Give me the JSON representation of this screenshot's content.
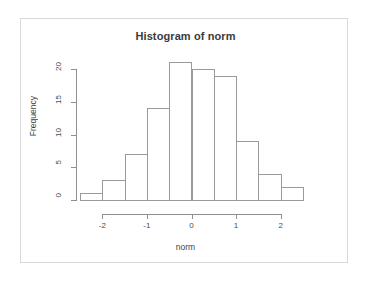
{
  "chart_data": {
    "type": "bar",
    "title": "Histogram of norm",
    "xlabel": "norm",
    "ylabel": "Frequency",
    "categories": [
      "-2.5",
      "-2.0",
      "-1.5",
      "-1.0",
      "-0.5",
      "0.0",
      "0.5",
      "1.0",
      "1.5",
      "2.0"
    ],
    "bin_edges": [
      -2.5,
      -2.0,
      -1.5,
      -1.0,
      -0.5,
      0.0,
      0.5,
      1.0,
      1.5,
      2.0,
      2.5
    ],
    "values": [
      1,
      3,
      7,
      14,
      21,
      20,
      19,
      9,
      4,
      2
    ],
    "bars": [
      {
        "left": -2.5,
        "right": -2.0,
        "count": 1
      },
      {
        "left": -2.0,
        "right": -1.5,
        "count": 3
      },
      {
        "left": -1.5,
        "right": -1.0,
        "count": 7
      },
      {
        "left": -1.0,
        "right": -0.5,
        "count": 14
      },
      {
        "left": -0.5,
        "right": 0.0,
        "count": 21
      },
      {
        "left": 0.0,
        "right": 0.5,
        "count": 20
      },
      {
        "left": 0.5,
        "right": 1.0,
        "count": 19
      },
      {
        "left": 1.0,
        "right": 1.5,
        "count": 9
      },
      {
        "left": 1.5,
        "right": 2.0,
        "count": 4
      },
      {
        "left": 2.0,
        "right": 2.5,
        "count": 2
      }
    ],
    "xlim": [
      -2.5,
      2.5
    ],
    "ylim": [
      0,
      20
    ],
    "x_ticks": [
      -2,
      -1,
      0,
      1,
      2
    ],
    "x_tick_labels": [
      "-2",
      "-1",
      "0",
      "1",
      "2"
    ],
    "y_ticks": [
      0,
      5,
      10,
      15,
      20
    ],
    "y_tick_labels": [
      "0",
      "5",
      "10",
      "15",
      "20"
    ],
    "grid": false,
    "legend": null,
    "bar_fill_color": "#ffffff",
    "bar_border_color": "#9a9a9a",
    "axis_color": "#8f8f8f",
    "title_color": "#3a3a3a",
    "background_color": "#ffffff"
  },
  "frame": {
    "border_color": "#d8d8d8"
  }
}
